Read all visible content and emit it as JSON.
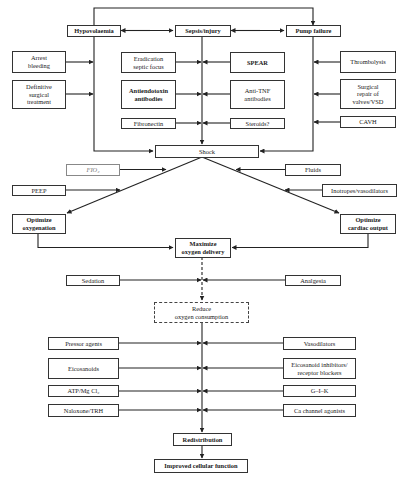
{
  "diagram": {
    "causes": {
      "hypovolaemia": "Hypovolaemia",
      "sepsis": "Sepsis/injury",
      "pump_failure": "Pump failure"
    },
    "hypovolaemia_treatments": [
      "Arrest\nbleeding",
      "Definitive\nsurgical\ntreatment"
    ],
    "sepsis_treatments_left": [
      "Eradication\nseptic focus",
      "Antiendotoxin\nantibodies",
      "Fibronectin"
    ],
    "sepsis_treatments_right": [
      "SPEAR",
      "Anti-TNF\nantibodies",
      "Steroids?"
    ],
    "pump_treatments": [
      "Thrombolysis",
      "Surgical\nrepair of\nvalves/VSD",
      "CAVH"
    ],
    "shock": "Shock",
    "oxygenation_inputs": [
      "FIO₂",
      "PEEP"
    ],
    "cardiac_inputs": [
      "Fluids",
      "Inotropes/vasodilators"
    ],
    "optimize_oxygenation": "Optimize\noxygenation",
    "optimize_cardiac_output": "Optimize\ncardiac output",
    "maximize_delivery": "Maximize\noxygen delivery",
    "consumption_inputs": [
      "Sedation",
      "Analgesia"
    ],
    "reduce_consumption": "Reduce\noxygen consumption",
    "redistribution_left": [
      "Pressor agents",
      "Eicosanoids",
      "ATP/Mg Cl₂",
      "Naloxone/TRH"
    ],
    "redistribution_right": [
      "Vasodilators",
      "Eicosanoid inhibitors/\nreceptor blockers",
      "G–I–K",
      "Ca channel agonists"
    ],
    "redistribution": "Redistribution",
    "outcome": "Improved cellular function"
  },
  "colors": {
    "line": "#222222",
    "box_border": "#333333",
    "background": "#ffffff"
  }
}
